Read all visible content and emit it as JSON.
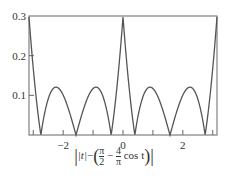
{
  "chart_data": {
    "type": "line",
    "title": "",
    "xlabel": "|t| − (π/2 − (4/π) cos t)",
    "ylabel": "",
    "xlim": [
      -3.14159,
      3.14159
    ],
    "ylim": [
      0,
      0.3
    ],
    "x_ticks": [
      -2,
      0,
      2
    ],
    "x_tick_labels": [
      "−2",
      "0",
      "2"
    ],
    "y_ticks": [
      0.1,
      0.2,
      0.3
    ],
    "y_tick_labels": [
      "0.1",
      "0.2",
      "0.3"
    ],
    "grid": false,
    "legend": null,
    "series": [
      {
        "name": "|t| - (pi/2 - (4/pi) cos t)",
        "function": "abs(abs(t) - (pi/2 - (4/pi)*cos(t)))",
        "color": "#555555",
        "x": [
          -3.14,
          -2.6,
          -2.1,
          -1.5,
          -0.85,
          -0.38,
          0,
          0.38,
          0.85,
          1.5,
          2.1,
          2.6,
          3.14
        ],
        "y": [
          0.3,
          0.0,
          0.12,
          0.0,
          0.12,
          0.0,
          0.3,
          0.0,
          0.12,
          0.0,
          0.12,
          0.0,
          0.3
        ]
      }
    ]
  },
  "labels": {
    "xlabel_abs_t": "|t|",
    "xlabel_minus": "−",
    "xlabel_pi": "π",
    "xlabel_2": "2",
    "xlabel_4": "4",
    "xlabel_cos": "cos t"
  }
}
